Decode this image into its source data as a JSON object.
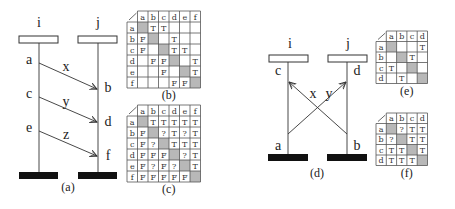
{
  "figure_a": {
    "caption": "(a)",
    "processes": [
      {
        "name": "i",
        "x": 39
      },
      {
        "name": "j",
        "x": 98
      }
    ],
    "events_i": [
      {
        "label": "a",
        "y": 63
      },
      {
        "label": "c",
        "y": 97
      },
      {
        "label": "e",
        "y": 131
      }
    ],
    "events_j": [
      {
        "label": "b",
        "y": 90
      },
      {
        "label": "d",
        "y": 123
      },
      {
        "label": "f",
        "y": 156
      }
    ],
    "messages": [
      {
        "label": "x",
        "from": "a",
        "to": "b"
      },
      {
        "label": "y",
        "from": "c",
        "to": "d"
      },
      {
        "label": "z",
        "from": "e",
        "to": "f"
      }
    ]
  },
  "figure_d": {
    "caption": "(d)",
    "processes": [
      {
        "name": "i",
        "x": 288
      },
      {
        "name": "j",
        "x": 347
      }
    ],
    "events": [
      {
        "label": "c",
        "process": "i",
        "position": "top"
      },
      {
        "label": "d",
        "process": "j",
        "position": "top"
      },
      {
        "label": "a",
        "process": "i",
        "position": "bottom"
      },
      {
        "label": "b",
        "process": "j",
        "position": "bottom"
      }
    ],
    "messages": [
      {
        "label": "x",
        "from": "b",
        "to": "c"
      },
      {
        "label": "y",
        "from": "a",
        "to": "d"
      }
    ]
  },
  "tables": {
    "b": {
      "caption": "(b)",
      "headers": [
        "a",
        "b",
        "c",
        "d",
        "e",
        "f"
      ],
      "rows": [
        {
          "label": "a",
          "cells": [
            "#",
            "T",
            "T",
            "",
            "",
            ""
          ]
        },
        {
          "label": "b",
          "cells": [
            "F",
            "#",
            "",
            "T",
            "",
            ""
          ]
        },
        {
          "label": "c",
          "cells": [
            "F",
            "",
            "#",
            "T",
            "T",
            ""
          ]
        },
        {
          "label": "d",
          "cells": [
            "",
            "F",
            "F",
            "#",
            "",
            "T"
          ]
        },
        {
          "label": "e",
          "cells": [
            "",
            "",
            "F",
            "",
            "#",
            "T"
          ]
        },
        {
          "label": "f",
          "cells": [
            "",
            "",
            "",
            "F",
            "F",
            "#"
          ]
        }
      ]
    },
    "c": {
      "caption": "(c)",
      "headers": [
        "a",
        "b",
        "c",
        "d",
        "e",
        "f"
      ],
      "rows": [
        {
          "label": "a",
          "cells": [
            "#",
            "T",
            "T",
            "T",
            "T",
            "T"
          ]
        },
        {
          "label": "b",
          "cells": [
            "F",
            "#",
            "?",
            "T",
            "?",
            "T"
          ]
        },
        {
          "label": "c",
          "cells": [
            "F",
            "?",
            "#",
            "T",
            "T",
            "T"
          ]
        },
        {
          "label": "d",
          "cells": [
            "F",
            "F",
            "F",
            "#",
            "?",
            "T"
          ]
        },
        {
          "label": "e",
          "cells": [
            "F",
            "?",
            "F",
            "?",
            "#",
            "T"
          ]
        },
        {
          "label": "f",
          "cells": [
            "F",
            "F",
            "F",
            "F",
            "F",
            "#"
          ]
        }
      ]
    },
    "e": {
      "caption": "(e)",
      "headers": [
        "a",
        "b",
        "c",
        "d"
      ],
      "rows": [
        {
          "label": "a",
          "cells": [
            "#",
            "",
            "",
            "T"
          ]
        },
        {
          "label": "b",
          "cells": [
            "",
            "#",
            "T",
            ""
          ]
        },
        {
          "label": "c",
          "cells": [
            "T",
            "",
            "#",
            ""
          ]
        },
        {
          "label": "d",
          "cells": [
            "",
            "T",
            "",
            "#"
          ]
        }
      ]
    },
    "f": {
      "caption": "(f)",
      "headers": [
        "a",
        "b",
        "c",
        "d"
      ],
      "rows": [
        {
          "label": "a",
          "cells": [
            "#",
            "?",
            "T",
            "T"
          ]
        },
        {
          "label": "b",
          "cells": [
            "?",
            "#",
            "T",
            "T"
          ]
        },
        {
          "label": "c",
          "cells": [
            "T",
            "T",
            "#",
            "T"
          ]
        },
        {
          "label": "d",
          "cells": [
            "T",
            "T",
            "T",
            "#"
          ]
        }
      ]
    }
  },
  "colors": {
    "diagonal_gray": "#b8b8b8",
    "line": "#333333",
    "bar": "#111111"
  }
}
